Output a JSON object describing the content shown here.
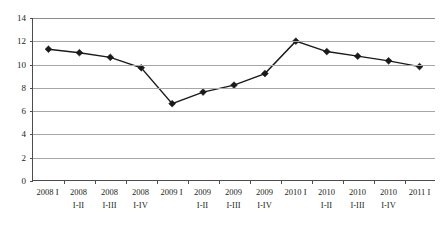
{
  "chart_data": {
    "type": "line",
    "title": "",
    "subtitle": "",
    "xlabel": "",
    "ylabel": "",
    "ylim": [
      0,
      14
    ],
    "ytick_step": 2,
    "yticks": [
      "14",
      "12",
      "10",
      "8",
      "6",
      "4",
      "2",
      "0"
    ],
    "ytick_values": [
      14,
      12,
      10,
      8,
      6,
      4,
      2,
      0
    ],
    "grid": true,
    "grid_axis": "y",
    "legend": false,
    "legend_position": "none",
    "marker": "diamond",
    "line_color": "#1a1a1a",
    "marker_color": "#1a1a1a",
    "grid_color": "#a6a6a6",
    "axis_color": "#4d4d4d",
    "background": "#ffffff",
    "categories": [
      "2008 I",
      "2008 I-II",
      "2008 I-III",
      "2008 I-IV",
      "2009 I",
      "2009 I-II",
      "2009 I-III",
      "2009 I-IV",
      "2010 I",
      "2010 I-II",
      "2010 I-III",
      "2010 I-IV",
      "2011 I"
    ],
    "category_lines": [
      {
        "l1": "2008 I",
        "l2": ""
      },
      {
        "l1": "2008",
        "l2": "I-II"
      },
      {
        "l1": "2008",
        "l2": "I-III"
      },
      {
        "l1": "2008",
        "l2": "I-IV"
      },
      {
        "l1": "2009 I",
        "l2": ""
      },
      {
        "l1": "2009",
        "l2": "I-II"
      },
      {
        "l1": "2009",
        "l2": "I-III"
      },
      {
        "l1": "2009",
        "l2": "I-IV"
      },
      {
        "l1": "2010 I",
        "l2": ""
      },
      {
        "l1": "2010",
        "l2": "I-II"
      },
      {
        "l1": "2010",
        "l2": "I-III"
      },
      {
        "l1": "2010",
        "l2": "I-IV"
      },
      {
        "l1": "2011 I",
        "l2": ""
      }
    ],
    "values": [
      11.3,
      11.0,
      10.6,
      9.7,
      6.6,
      7.6,
      8.2,
      9.2,
      12.0,
      11.1,
      10.7,
      10.3,
      9.8
    ]
  }
}
